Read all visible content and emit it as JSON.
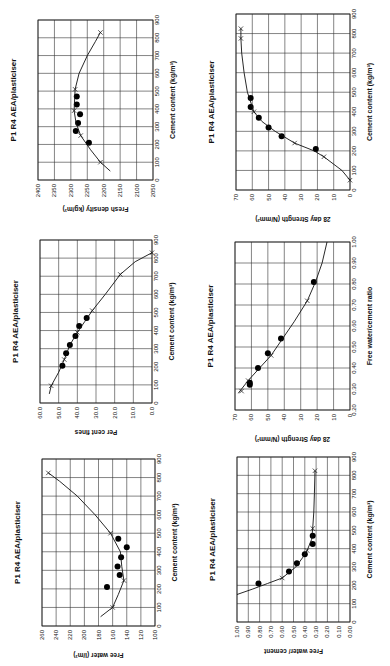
{
  "chart_data": [
    {
      "id": "fresh-density",
      "type": "scatter",
      "title": "P1 R4 AEA/plasticiser",
      "xlabel": "Cement content (kg/m³)",
      "ylabel": "Fresh density  (kg/m³)",
      "xlim": [
        0,
        900
      ],
      "ylim": [
        2050,
        2400
      ],
      "xticks": [
        "0",
        "100",
        "200",
        "300",
        "400",
        "500",
        "600",
        "700",
        "800",
        "900"
      ],
      "yticks": [
        "2050",
        "2100",
        "2150",
        "2200",
        "2250",
        "2300",
        "2350",
        "2400"
      ],
      "grid": true,
      "series": [
        {
          "name": "measured",
          "marker": "dot",
          "points": [
            [
              210,
              2245
            ],
            [
              275,
              2285
            ],
            [
              320,
              2278
            ],
            [
              370,
              2272
            ],
            [
              425,
              2282
            ],
            [
              470,
              2282
            ]
          ]
        },
        {
          "name": "fitted",
          "marker": "x",
          "points": [
            [
              100,
              2210
            ],
            [
              250,
              2270
            ],
            [
              390,
              2290
            ],
            [
              510,
              2287
            ],
            [
              830,
              2210
            ]
          ]
        },
        {
          "name": "curve",
          "marker": "line",
          "points": [
            [
              50,
              2180
            ],
            [
              100,
              2210
            ],
            [
              170,
              2240
            ],
            [
              250,
              2270
            ],
            [
              320,
              2284
            ],
            [
              390,
              2290
            ],
            [
              510,
              2287
            ],
            [
              600,
              2275
            ],
            [
              700,
              2250
            ],
            [
              780,
              2225
            ],
            [
              830,
              2210
            ]
          ]
        }
      ]
    },
    {
      "id": "strength-cement",
      "type": "scatter",
      "title": "P1 R4 AEA/plasticiser",
      "xlabel": "Cement content (kg/m³)",
      "ylabel": "28 day Strength  (N/mm²)",
      "xlim": [
        0,
        900
      ],
      "ylim": [
        0,
        70
      ],
      "xticks": [
        "0",
        "100",
        "200",
        "300",
        "400",
        "500",
        "600",
        "700",
        "800",
        "900"
      ],
      "yticks": [
        "0",
        "10",
        "20",
        "30",
        "40",
        "50",
        "60",
        "70"
      ],
      "grid": true,
      "series": [
        {
          "name": "measured",
          "marker": "dot",
          "points": [
            [
              210,
              21
            ],
            [
              275,
              42
            ],
            [
              320,
              50
            ],
            [
              370,
              56
            ],
            [
              425,
              61
            ],
            [
              470,
              61
            ]
          ]
        },
        {
          "name": "fitted",
          "marker": "x",
          "points": [
            [
              50,
              0
            ],
            [
              170,
              16
            ],
            [
              240,
              34
            ],
            [
              400,
              59
            ],
            [
              775,
              67
            ],
            [
              825,
              67
            ]
          ]
        },
        {
          "name": "curve",
          "marker": "line",
          "points": [
            [
              50,
              0
            ],
            [
              100,
              5
            ],
            [
              170,
              16
            ],
            [
              200,
              22
            ],
            [
              240,
              34
            ],
            [
              300,
              46
            ],
            [
              350,
              54
            ],
            [
              400,
              59
            ],
            [
              500,
              63
            ],
            [
              600,
              65
            ],
            [
              700,
              66.5
            ],
            [
              775,
              67
            ],
            [
              825,
              67
            ]
          ]
        }
      ]
    },
    {
      "id": "per-cent-fines",
      "type": "scatter",
      "title": "P1 R4 AEA/plasticiser",
      "xlabel": "Cement content (kg/m³)",
      "ylabel": "Per cent fines",
      "xlim": [
        0,
        900
      ],
      "ylim": [
        0,
        60
      ],
      "xticks": [
        "0",
        "100",
        "200",
        "300",
        "400",
        "500",
        "600",
        "700",
        "800",
        "900"
      ],
      "yticks": [
        "0.0",
        "10.0",
        "20.0",
        "30.0",
        "40.0",
        "50.0",
        "60.0"
      ],
      "grid": true,
      "series": [
        {
          "name": "measured",
          "marker": "dot",
          "points": [
            [
              205,
              48
            ],
            [
              275,
              46
            ],
            [
              320,
              44
            ],
            [
              370,
              41
            ],
            [
              425,
              39
            ],
            [
              470,
              35
            ]
          ]
        },
        {
          "name": "fitted",
          "marker": "x",
          "points": [
            [
              95,
              54
            ],
            [
              240,
              47
            ],
            [
              390,
              40
            ],
            [
              510,
              32
            ],
            [
              710,
              17
            ],
            [
              830,
              0
            ]
          ]
        },
        {
          "name": "curve",
          "marker": "line",
          "points": [
            [
              50,
              55
            ],
            [
              95,
              54
            ],
            [
              170,
              50
            ],
            [
              240,
              47
            ],
            [
              320,
              44
            ],
            [
              390,
              40
            ],
            [
              450,
              36
            ],
            [
              510,
              32
            ],
            [
              600,
              25
            ],
            [
              710,
              17
            ],
            [
              780,
              9
            ],
            [
              830,
              0
            ]
          ]
        }
      ]
    },
    {
      "id": "strength-wc",
      "type": "scatter",
      "title": "P1 R4 AEA/plasticiser",
      "xlabel": "Free water/cement ratio",
      "ylabel": "28 day Strength  (N/mm²)",
      "xlim": [
        0.2,
        1.0
      ],
      "ylim": [
        0,
        70
      ],
      "xticks": [
        "0.20",
        "0.30",
        "0.40",
        "0.50",
        "0.60",
        "0.70",
        "0.80",
        "0.90",
        "1.00"
      ],
      "yticks": [
        "0",
        "10",
        "20",
        "30",
        "40",
        "50",
        "60",
        "70"
      ],
      "grid": true,
      "series": [
        {
          "name": "measured",
          "marker": "dot",
          "points": [
            [
              0.32,
              61
            ],
            [
              0.33,
              61
            ],
            [
              0.4,
              56
            ],
            [
              0.47,
              50
            ],
            [
              0.54,
              42
            ],
            [
              0.81,
              22
            ]
          ]
        },
        {
          "name": "fitted",
          "marker": "x",
          "points": [
            [
              0.29,
              66
            ],
            [
              0.34,
              62
            ],
            [
              0.46,
              48
            ],
            [
              0.72,
              26
            ]
          ]
        },
        {
          "name": "curve",
          "marker": "line",
          "points": [
            [
              0.28,
              68
            ],
            [
              0.34,
              62
            ],
            [
              0.4,
              55
            ],
            [
              0.46,
              48
            ],
            [
              0.54,
              41
            ],
            [
              0.62,
              34
            ],
            [
              0.72,
              26
            ],
            [
              0.81,
              21
            ],
            [
              0.9,
              17
            ],
            [
              1.0,
              14
            ]
          ]
        }
      ]
    },
    {
      "id": "free-water",
      "type": "scatter",
      "title": "P1 R4 AEA/plasticiser",
      "xlabel": "Cement content (kg/m³)",
      "ylabel": "Free water (l/m³)",
      "xlim": [
        0,
        900
      ],
      "ylim": [
        100,
        260
      ],
      "xticks": [
        "0",
        "100",
        "200",
        "300",
        "400",
        "500",
        "600",
        "700",
        "800",
        "900"
      ],
      "yticks": [
        "100",
        "120",
        "140",
        "160",
        "180",
        "200",
        "220",
        "240",
        "260"
      ],
      "grid": true,
      "series": [
        {
          "name": "measured",
          "marker": "dot",
          "points": [
            [
              210,
              168
            ],
            [
              275,
              150
            ],
            [
              320,
              153
            ],
            [
              370,
              148
            ],
            [
              425,
              140
            ],
            [
              470,
              152
            ]
          ]
        },
        {
          "name": "fitted",
          "marker": "x",
          "points": [
            [
              100,
              160
            ],
            [
              245,
              144
            ],
            [
              500,
              163
            ],
            [
              825,
              251
            ]
          ]
        },
        {
          "name": "curve",
          "marker": "line",
          "points": [
            [
              50,
              177
            ],
            [
              100,
              160
            ],
            [
              170,
              152
            ],
            [
              245,
              144
            ],
            [
              320,
              147
            ],
            [
              400,
              149
            ],
            [
              500,
              163
            ],
            [
              600,
              185
            ],
            [
              700,
              210
            ],
            [
              780,
              235
            ],
            [
              825,
              251
            ]
          ]
        }
      ]
    },
    {
      "id": "water-cement",
      "type": "scatter",
      "title": "P1 R4 AEA/plasticiser",
      "xlabel": "Cement content (kg/m³)",
      "ylabel": "Free water/ cement",
      "xlim": [
        0,
        900
      ],
      "ylim": [
        0,
        1.0
      ],
      "xticks": [
        "0",
        "100",
        "200",
        "300",
        "400",
        "500",
        "600",
        "700",
        "800",
        "900"
      ],
      "yticks": [
        "0.00",
        "0.10",
        "0.20",
        "0.30",
        "0.40",
        "0.50",
        "0.60",
        "0.70",
        "0.80",
        "0.90",
        "1.00"
      ],
      "grid": true,
      "series": [
        {
          "name": "measured",
          "marker": "dot",
          "points": [
            [
              210,
              0.81
            ],
            [
              275,
              0.54
            ],
            [
              320,
              0.47
            ],
            [
              370,
              0.4
            ],
            [
              425,
              0.33
            ],
            [
              470,
              0.33
            ]
          ]
        },
        {
          "name": "fitted",
          "marker": "x",
          "points": [
            [
              240,
              0.6
            ],
            [
              390,
              0.38
            ],
            [
              510,
              0.33
            ],
            [
              825,
              0.31
            ]
          ]
        },
        {
          "name": "curve",
          "marker": "line",
          "points": [
            [
              150,
              1.0
            ],
            [
              180,
              0.86
            ],
            [
              210,
              0.73
            ],
            [
              240,
              0.6
            ],
            [
              300,
              0.48
            ],
            [
              350,
              0.42
            ],
            [
              390,
              0.38
            ],
            [
              450,
              0.34
            ],
            [
              510,
              0.33
            ],
            [
              600,
              0.32
            ],
            [
              700,
              0.315
            ],
            [
              825,
              0.31
            ]
          ]
        }
      ]
    }
  ]
}
